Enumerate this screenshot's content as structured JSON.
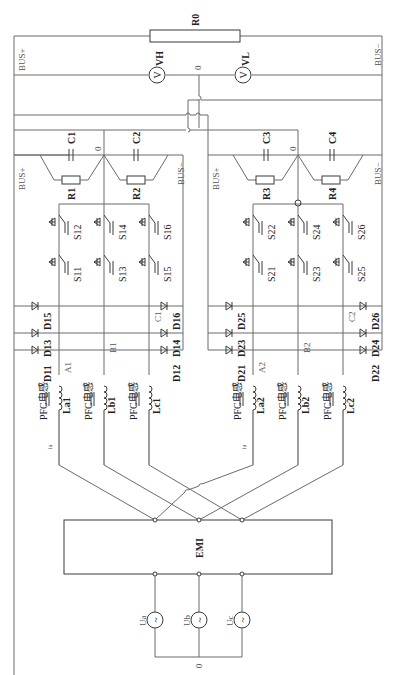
{
  "diagram": {
    "orientation": "rotated 90deg (text reads bottom-to-top)",
    "load": {
      "resistor": "R0"
    },
    "bus": {
      "positive": "BUS+",
      "negative": "BUS−",
      "neutral": "0"
    },
    "meters": [
      {
        "label": "VH",
        "symbol": "V"
      },
      {
        "label": "VL",
        "symbol": "V"
      }
    ],
    "module1": {
      "bus_pos": "BUS+",
      "bus_neg": "BUS−",
      "mid": "0",
      "capacitors": [
        "C1",
        "C2"
      ],
      "resistors": [
        "R1",
        "R2"
      ],
      "switches": [
        "S11",
        "S12",
        "S13",
        "S14",
        "S15",
        "S16"
      ],
      "diodes": [
        "D11",
        "D12",
        "D13",
        "D14",
        "D15",
        "D16"
      ],
      "phase_nodes": [
        "A1",
        "B1",
        "C1"
      ],
      "inductors": [
        {
          "type": "PFC电感",
          "name": "La1"
        },
        {
          "type": "PFC电感",
          "name": "Lb1"
        },
        {
          "type": "PFC电感",
          "name": "Lc1"
        }
      ],
      "current_label": "ia"
    },
    "module2": {
      "bus_pos": "BUS+",
      "bus_neg": "BUS−",
      "mid": "0",
      "capacitors": [
        "C3",
        "C4"
      ],
      "resistors": [
        "R3",
        "R4"
      ],
      "switches": [
        "S21",
        "S22",
        "S23",
        "S24",
        "S25",
        "S26"
      ],
      "diodes": [
        "D21",
        "D22",
        "D23",
        "D24",
        "D25",
        "D26"
      ],
      "phase_nodes": [
        "A2",
        "B2",
        "C2"
      ],
      "inductors": [
        {
          "type": "PFC电感",
          "name": "La2"
        },
        {
          "type": "PFC电感",
          "name": "Lb2"
        },
        {
          "type": "PFC电感",
          "name": "Lc2"
        }
      ],
      "current_label": "ia"
    },
    "filter": {
      "label": "EMI"
    },
    "sources": [
      {
        "label": "Ua",
        "symbol": "~"
      },
      {
        "label": "Ub",
        "symbol": "~"
      },
      {
        "label": "Uc",
        "symbol": "~"
      }
    ],
    "source_neutral": "0"
  }
}
